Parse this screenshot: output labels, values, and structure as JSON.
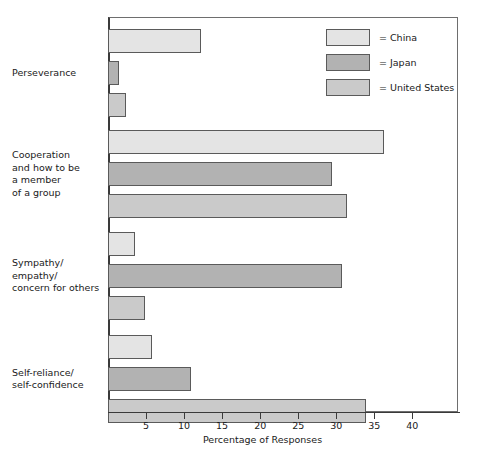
{
  "chart_data": {
    "type": "bar",
    "orientation": "horizontal",
    "title": "",
    "xlabel": "Percentage of Responses",
    "ylabel": "",
    "xlim": [
      0,
      46
    ],
    "xticks": [
      5,
      10,
      15,
      20,
      25,
      30,
      35,
      40
    ],
    "xtick_labels": [
      "5",
      "10",
      "15",
      "20",
      "25",
      "30",
      "35",
      "40"
    ],
    "grid": false,
    "legend_position": "top-right",
    "categories": [
      "Perseverance",
      "Cooperation and how to be a member of a group",
      "Sympathy/ empathy/ concern for others",
      "Self-reliance/ self-confidence"
    ],
    "category_label_lines": [
      [
        "Perseverance"
      ],
      [
        "Cooperation",
        "and how to be",
        "a member",
        "of a group"
      ],
      [
        "Sympathy/",
        "empathy/",
        "concern for others"
      ],
      [
        "Self-reliance/",
        "self-confidence"
      ]
    ],
    "series": [
      {
        "name": "China",
        "color": "#e4e4e4",
        "values": [
          12.2,
          36.3,
          3.6,
          5.8
        ]
      },
      {
        "name": "Japan",
        "color": "#b2b2b2",
        "values": [
          1.5,
          29.4,
          30.7,
          10.9
        ]
      },
      {
        "name": "United States",
        "color": "#cacaca",
        "values": [
          2.4,
          31.4,
          4.8,
          33.9
        ]
      }
    ]
  },
  "legend": {
    "items": [
      {
        "label": "= China",
        "series": "China"
      },
      {
        "label": "= Japan",
        "series": "Japan"
      },
      {
        "label": "= United States",
        "series": "United States"
      }
    ]
  },
  "axis": {
    "x_title": "Percentage of Responses"
  },
  "colors": {
    "china": "#e4e4e4",
    "japan": "#b2b2b2",
    "united_states": "#cacaca",
    "bar_border": "#5a5a5a",
    "axis": "#3a3a3a",
    "frame": "#6e6e6e",
    "background": "#ffffff",
    "text": "#1a1a1a"
  }
}
